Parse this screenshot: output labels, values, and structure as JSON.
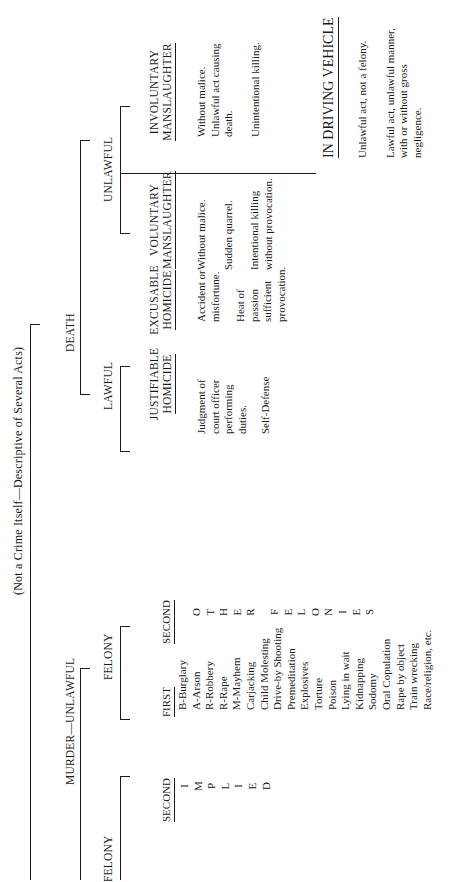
{
  "title": "(Not a Crime Itself—Descriptive of Several Acts)",
  "root": "DEATH",
  "murder": {
    "label": "MURDER—UNLAWFUL",
    "felony_left": {
      "label": "FELONY",
      "second": "SECOND",
      "second_letters": [
        "I",
        "M",
        "P",
        "L",
        "I",
        "E",
        "D"
      ]
    },
    "felony_right": {
      "label": "FELONY",
      "first": "FIRST",
      "first_items": [
        "B-Burglary",
        "A-Arson",
        "R-Robbery",
        "R-Rape",
        "M-Mayhem",
        "Carjacking",
        "Child Molesting",
        "Drive-by Shooting",
        "Premeditation",
        "Explosives",
        "Torture",
        "Poison",
        "Lying in wait",
        "Kidnapping",
        "Sodomy",
        "Oral Copulation",
        "Rape by object",
        "Train wrecking",
        "Race/religion, etc."
      ],
      "second": "SECOND",
      "second_letters_a": [
        "O",
        "T",
        "H",
        "E",
        "R"
      ],
      "second_letters_b": [
        "F",
        "E",
        "L",
        "O",
        "N",
        "I",
        "E",
        "S"
      ]
    }
  },
  "lawful": {
    "label": "LAWFUL",
    "justifiable": {
      "title1": "JUSTIFIABLE",
      "title2": "HOMICIDE",
      "items": [
        "Judgment of",
        "court officer",
        "performing",
        "duties.",
        "",
        "Self-Defense"
      ]
    },
    "excusable": {
      "title1": "EXCUSABLE",
      "title2": "HOMICIDE",
      "items": [
        "Accident or",
        "misfortune.",
        "",
        "Heat of",
        "passion",
        "sufficient",
        "provocation."
      ]
    }
  },
  "unlawful": {
    "label": "UNLAWFUL",
    "voluntary": {
      "title1": "VOLUNTARY",
      "title2": "MANSLAUGHTER",
      "items": [
        "Without malice.",
        "",
        "Sudden quarrel.",
        "",
        "Intentional killing",
        "without provocation."
      ]
    },
    "involuntary": {
      "title1": "INVOLUNTARY",
      "title2": "MANSLAUGHTER",
      "items": [
        "Without malice.",
        "Unlawful act causing",
        "death.",
        "",
        "Unintentional killing."
      ]
    },
    "vehicle": {
      "title": "IN DRIVING VEHICLE",
      "items": [
        "Unlawful act, not a felony.",
        "",
        "Lawful act, unlawful manner,",
        "with or without gross",
        "negligence."
      ]
    }
  }
}
